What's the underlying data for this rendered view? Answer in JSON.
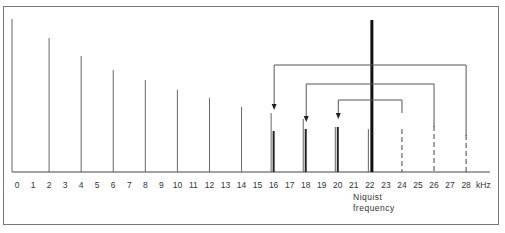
{
  "chart_data": {
    "type": "bar",
    "title": "",
    "xlabel": "kHz",
    "ylabel": "",
    "x_ticks": [
      0,
      1,
      2,
      3,
      4,
      5,
      6,
      7,
      8,
      9,
      10,
      11,
      12,
      13,
      14,
      15,
      16,
      17,
      18,
      19,
      20,
      21,
      22,
      23,
      24,
      25,
      26,
      27,
      28
    ],
    "x_unit_label": "kHz",
    "annotation": [
      "Niquist",
      "frequency"
    ],
    "nyquist_khz": 22,
    "series": [
      {
        "name": "original spectral lines",
        "style": "thin-solid",
        "points": [
          {
            "x": 0,
            "height": 153
          },
          {
            "x": 2,
            "height": 134
          },
          {
            "x": 4,
            "height": 116
          },
          {
            "x": 6,
            "height": 102
          },
          {
            "x": 8,
            "height": 92
          },
          {
            "x": 10,
            "height": 82
          },
          {
            "x": 12,
            "height": 74
          },
          {
            "x": 14,
            "height": 65
          },
          {
            "x": 16,
            "height": 59
          },
          {
            "x": 18,
            "height": 53
          },
          {
            "x": 20,
            "height": 45
          },
          {
            "x": 22,
            "height": 43
          }
        ]
      },
      {
        "name": "aliased components (above Nyquist, folded back)",
        "style": "dashed",
        "points": [
          {
            "x": 24,
            "height": 43
          },
          {
            "x": 26,
            "height": 46
          },
          {
            "x": 28,
            "height": 37
          }
        ]
      },
      {
        "name": "alias images",
        "style": "thick-solid",
        "points": [
          {
            "x": 16,
            "height": 41
          },
          {
            "x": 18,
            "height": 43
          },
          {
            "x": 20,
            "height": 45
          }
        ]
      },
      {
        "name": "Nyquist marker",
        "style": "bold",
        "points": [
          {
            "x": 22,
            "height": 152
          }
        ]
      }
    ],
    "fold_arrows": [
      {
        "from": 24,
        "to": 20,
        "bracket_y": 100
      },
      {
        "from": 26,
        "to": 18,
        "bracket_y": 84
      },
      {
        "from": 28,
        "to": 16,
        "bracket_y": 65
      }
    ],
    "grid": false,
    "legend": "none"
  }
}
